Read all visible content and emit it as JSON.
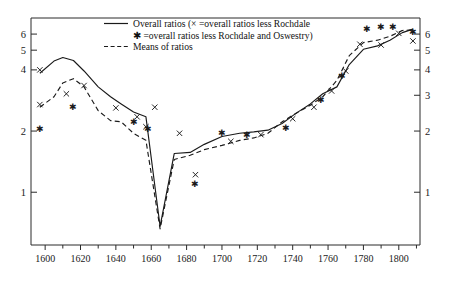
{
  "chart_data": {
    "type": "line",
    "title": "",
    "subtitle": "",
    "xlabel": "",
    "ylabel": "",
    "yscale": "log",
    "xlim": [
      1592,
      1812
    ],
    "ylim": [
      0.55,
      7.2
    ],
    "grid": false,
    "legend_position": "top-center",
    "x_major_ticks": [
      1600,
      1620,
      1640,
      1660,
      1680,
      1700,
      1720,
      1740,
      1760,
      1780,
      1800
    ],
    "x_minor_ticks": [
      1610,
      1630,
      1650,
      1670,
      1690,
      1710,
      1730,
      1750,
      1770,
      1790,
      1810
    ],
    "x_tick_labels": [
      "1600",
      "1620",
      "1640",
      "1660",
      "1680",
      "1700",
      "1720",
      "1740",
      "1760",
      "1780",
      "1800"
    ],
    "y_ticks_left": [
      1,
      2,
      4,
      5,
      6
    ],
    "y_tick_labels_left": [
      "1",
      "2",
      "4",
      "5",
      "6"
    ],
    "y_ticks_right": [
      1,
      2,
      3,
      4,
      5,
      6
    ],
    "y_tick_labels_right": [
      "1",
      "2",
      "3",
      "4",
      "5",
      "6"
    ],
    "legend": [
      {
        "key": "overall-ratios",
        "label": "Overall ratios (× =overall ratios less Rochdale",
        "marker": "solid-line"
      },
      {
        "key": "overall-ratios-note",
        "label": "✱ =overall ratios less Rochdale and Oswestry)",
        "marker": "star"
      },
      {
        "key": "means-of-ratios",
        "label": "Means of ratios",
        "marker": "dashed-line"
      }
    ],
    "series": [
      {
        "name": "Overall ratios",
        "style": "solid",
        "x": [
          1597,
          1605,
          1610,
          1616,
          1622,
          1630,
          1637,
          1643,
          1650,
          1657,
          1665,
          1673,
          1682,
          1690,
          1700,
          1710,
          1718,
          1726,
          1734,
          1742,
          1750,
          1757,
          1765,
          1772,
          1780,
          1788,
          1795,
          1802,
          1808
        ],
        "y": [
          3.85,
          4.42,
          4.6,
          4.45,
          3.95,
          3.3,
          2.95,
          2.72,
          2.48,
          2.35,
          0.68,
          1.55,
          1.57,
          1.72,
          1.88,
          1.95,
          1.98,
          2.02,
          2.18,
          2.45,
          2.72,
          3.05,
          3.3,
          4.25,
          5.05,
          5.25,
          5.6,
          6.1,
          6.35
        ]
      },
      {
        "name": "Means of ratios",
        "style": "dashed",
        "x": [
          1597,
          1605,
          1610,
          1616,
          1622,
          1630,
          1637,
          1643,
          1650,
          1657,
          1665,
          1673,
          1682,
          1690,
          1700,
          1710,
          1718,
          1726,
          1734,
          1742,
          1750,
          1757,
          1765,
          1772,
          1780,
          1788,
          1795,
          1802,
          1808
        ],
        "y": [
          2.62,
          2.95,
          3.45,
          3.62,
          3.3,
          2.52,
          2.25,
          2.22,
          1.95,
          1.8,
          0.66,
          1.45,
          1.52,
          1.62,
          1.7,
          1.8,
          1.85,
          1.95,
          2.22,
          2.45,
          2.68,
          2.95,
          3.55,
          4.7,
          5.45,
          5.6,
          5.85,
          6.25,
          6.3
        ]
      }
    ],
    "scatter_x_markers": {
      "name": "overall ratios less Rochdale",
      "symbol": "×",
      "points": [
        {
          "x": 1597,
          "y": 4.0
        },
        {
          "x": 1597,
          "y": 2.7
        },
        {
          "x": 1612,
          "y": 3.05
        },
        {
          "x": 1622,
          "y": 3.35
        },
        {
          "x": 1640,
          "y": 2.6
        },
        {
          "x": 1652,
          "y": 2.35
        },
        {
          "x": 1657,
          "y": 2.1
        },
        {
          "x": 1662,
          "y": 2.62
        },
        {
          "x": 1676,
          "y": 1.95
        },
        {
          "x": 1685,
          "y": 1.22
        },
        {
          "x": 1705,
          "y": 1.78
        },
        {
          "x": 1722,
          "y": 1.92
        },
        {
          "x": 1740,
          "y": 2.3
        },
        {
          "x": 1752,
          "y": 2.62
        },
        {
          "x": 1762,
          "y": 3.15
        },
        {
          "x": 1770,
          "y": 3.95
        },
        {
          "x": 1778,
          "y": 5.35
        },
        {
          "x": 1790,
          "y": 5.3
        },
        {
          "x": 1800,
          "y": 6.05
        },
        {
          "x": 1808,
          "y": 5.55
        }
      ]
    },
    "scatter_star_markers": {
      "name": "overall ratios less Rochdale and Oswestry",
      "symbol": "✱",
      "points": [
        {
          "x": 1597,
          "y": 2.05
        },
        {
          "x": 1616,
          "y": 2.62
        },
        {
          "x": 1650,
          "y": 2.22
        },
        {
          "x": 1658,
          "y": 2.05
        },
        {
          "x": 1685,
          "y": 1.1
        },
        {
          "x": 1700,
          "y": 1.95
        },
        {
          "x": 1714,
          "y": 1.92
        },
        {
          "x": 1736,
          "y": 2.08
        },
        {
          "x": 1756,
          "y": 2.85
        },
        {
          "x": 1768,
          "y": 3.75
        },
        {
          "x": 1782,
          "y": 6.35
        },
        {
          "x": 1790,
          "y": 6.55
        },
        {
          "x": 1797,
          "y": 6.55
        },
        {
          "x": 1808,
          "y": 6.15
        }
      ]
    }
  }
}
